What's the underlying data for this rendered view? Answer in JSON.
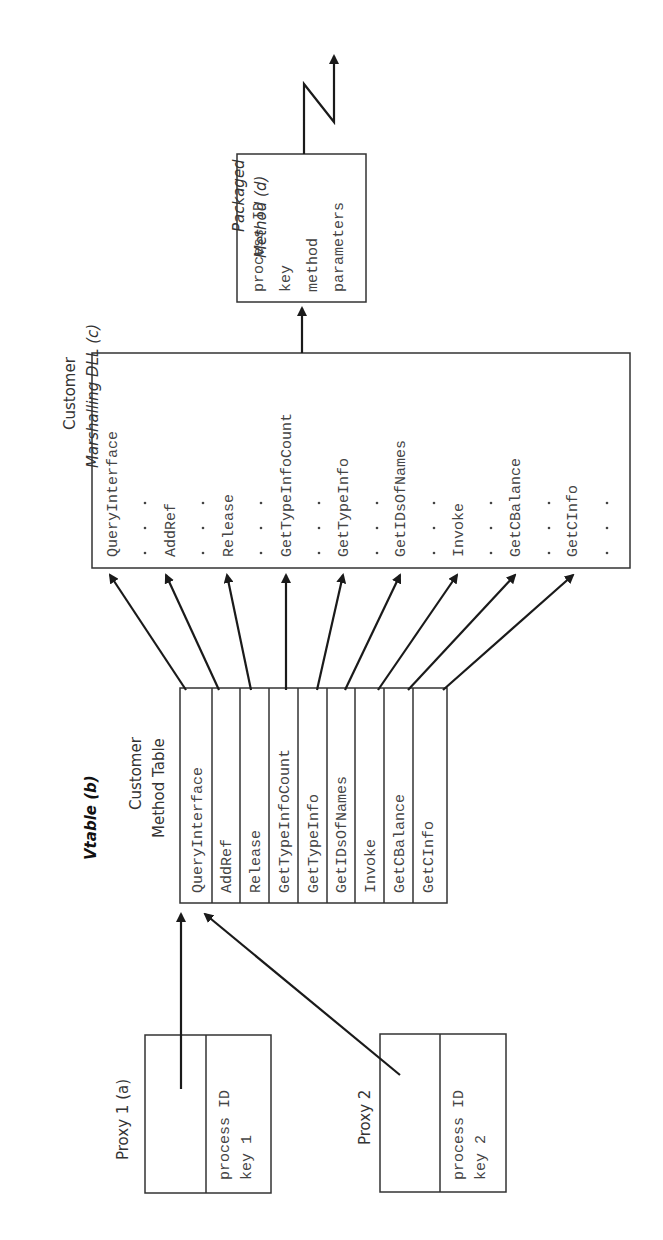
{
  "proxy1": {
    "label": "Proxy 1 (a)",
    "lines": [
      "process ID",
      "key 1"
    ]
  },
  "proxy2": {
    "label": "Proxy 2",
    "lines": [
      "process ID",
      "key 2"
    ]
  },
  "vtable": {
    "title": "Vtable (b)",
    "subtitle1": "Customer",
    "subtitle2": "Method Table",
    "entries": [
      "QueryInterface",
      "AddRef",
      "Release",
      "GetTypeInfoCount",
      "GetTypeInfo",
      "GetIDsOfNames",
      "Invoke",
      "GetCBalance",
      "GetCInfo"
    ]
  },
  "dll": {
    "title1": "Customer",
    "title2": "Marshalling DLL (c)",
    "entries": [
      "QueryInterface",
      "AddRef",
      "Release",
      "GetTypeInfoCount",
      "GetTypeInfo",
      "GetIDsOfNames",
      "Invoke",
      "GetCBalance",
      "GetCInfo"
    ]
  },
  "packaged": {
    "title1": "Packaged",
    "title2": "Method (d)",
    "lines": [
      "process ID",
      "key",
      "method",
      "parameters"
    ]
  }
}
